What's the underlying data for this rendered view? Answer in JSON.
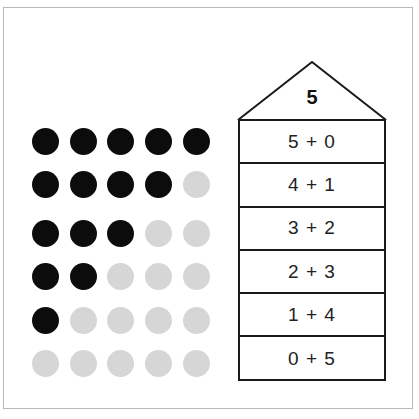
{
  "title_number": "5",
  "decompositions": [
    {
      "label": "5 + 0",
      "filled": 5
    },
    {
      "label": "4 + 1",
      "filled": 4
    },
    {
      "label": "3 + 2",
      "filled": 3
    },
    {
      "label": "2 + 3",
      "filled": 2
    },
    {
      "label": "1 + 4",
      "filled": 1
    },
    {
      "label": "0 + 5",
      "filled": 0
    }
  ],
  "dots_per_row": 5,
  "colors": {
    "filled": "#0c0c0c",
    "empty": "#d6d6d6",
    "line": "#1a1a1a"
  }
}
